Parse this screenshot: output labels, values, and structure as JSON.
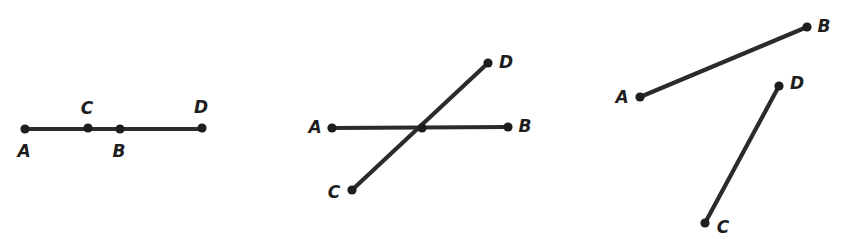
{
  "canvas": {
    "width": 850,
    "height": 239,
    "background_color": "#ffffff",
    "stroke_color": "#2b2b2b",
    "dot_color": "#1e1e1e",
    "label_color": "#1e1e1e",
    "line_width": 4.2,
    "dot_radius": 4.6
  },
  "figures": [
    {
      "id": "figure-1",
      "description": "collinear-points-single-segment",
      "segments": [
        {
          "name": "segment-AD",
          "x1": 25,
          "y1": 129,
          "x2": 202,
          "y2": 129
        }
      ],
      "points": [
        {
          "id": "fig1-A",
          "label": "A",
          "x": 25,
          "y": 129,
          "label_x": 24,
          "label_y": 151
        },
        {
          "id": "fig1-C",
          "label": "C",
          "x": 88,
          "y": 128,
          "label_x": 87,
          "label_y": 108
        },
        {
          "id": "fig1-B",
          "label": "B",
          "x": 120,
          "y": 129,
          "label_x": 119,
          "label_y": 151
        },
        {
          "id": "fig1-D",
          "label": "D",
          "x": 202,
          "y": 128,
          "label_x": 201,
          "label_y": 107
        }
      ]
    },
    {
      "id": "figure-2",
      "description": "two-intersecting-segments",
      "segments": [
        {
          "name": "segment-AB",
          "x1": 332,
          "y1": 128,
          "x2": 508,
          "y2": 127
        },
        {
          "name": "segment-CD",
          "x1": 352,
          "y1": 190,
          "x2": 488,
          "y2": 63
        }
      ],
      "intersection": {
        "id": "fig2-crossing",
        "x": 422,
        "y": 128
      },
      "points": [
        {
          "id": "fig2-A",
          "label": "A",
          "x": 332,
          "y": 128,
          "label_x": 315,
          "label_y": 127
        },
        {
          "id": "fig2-B",
          "label": "B",
          "x": 508,
          "y": 127,
          "label_x": 525,
          "label_y": 126
        },
        {
          "id": "fig2-C",
          "label": "C",
          "x": 352,
          "y": 190,
          "label_x": 334,
          "label_y": 192
        },
        {
          "id": "fig2-D",
          "label": "D",
          "x": 488,
          "y": 63,
          "label_x": 506,
          "label_y": 62
        }
      ]
    },
    {
      "id": "figure-3",
      "description": "two-disjoint-segments",
      "segments": [
        {
          "name": "segment-AB",
          "x1": 640,
          "y1": 97,
          "x2": 807,
          "y2": 27
        },
        {
          "name": "segment-CD",
          "x1": 705,
          "y1": 223,
          "x2": 779,
          "y2": 86
        }
      ],
      "points": [
        {
          "id": "fig3-A",
          "label": "A",
          "x": 640,
          "y": 97,
          "label_x": 622,
          "label_y": 97
        },
        {
          "id": "fig3-B",
          "label": "B",
          "x": 807,
          "y": 27,
          "label_x": 824,
          "label_y": 26
        },
        {
          "id": "fig3-C",
          "label": "C",
          "x": 705,
          "y": 223,
          "label_x": 723,
          "label_y": 227
        },
        {
          "id": "fig3-D",
          "label": "D",
          "x": 779,
          "y": 86,
          "label_x": 797,
          "label_y": 83
        }
      ]
    }
  ]
}
